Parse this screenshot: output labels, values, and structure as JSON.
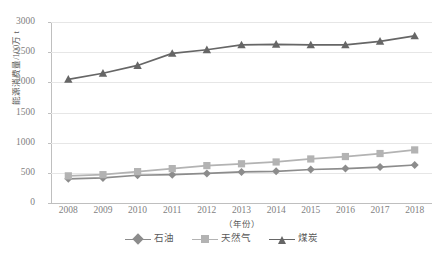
{
  "chart_data": {
    "type": "line",
    "title": "",
    "xlabel": "（年份）",
    "ylabel": "能源消费量/100万 t",
    "x": [
      2008,
      2009,
      2010,
      2011,
      2012,
      2013,
      2014,
      2015,
      2016,
      2017,
      2018
    ],
    "categories": [
      "2008",
      "2009",
      "2010",
      "2011",
      "2012",
      "2013",
      "2014",
      "2015",
      "2016",
      "2017",
      "2018"
    ],
    "ylim": [
      0,
      3000
    ],
    "yticks": [
      0,
      500,
      1000,
      1500,
      2000,
      2500,
      3000
    ],
    "ytick_labels": [
      "0",
      "500",
      "1000",
      "1500",
      "2000",
      "2500",
      "3000"
    ],
    "grid": true,
    "legend_position": "bottom",
    "series": [
      {
        "name": "石油",
        "marker": "diamond",
        "color": "#8c8c8c",
        "values": [
          400,
          415,
          460,
          470,
          490,
          515,
          525,
          555,
          570,
          595,
          630
        ]
      },
      {
        "name": "天然气",
        "marker": "square",
        "color": "#b3b3b3",
        "values": [
          450,
          470,
          520,
          570,
          620,
          650,
          680,
          730,
          770,
          820,
          880
        ]
      },
      {
        "name": "煤炭",
        "marker": "triangle",
        "color": "#666666",
        "values": [
          2050,
          2150,
          2280,
          2480,
          2540,
          2620,
          2630,
          2620,
          2620,
          2680,
          2770
        ]
      }
    ]
  },
  "legend": {
    "items": [
      {
        "label": "石油"
      },
      {
        "label": "天然气"
      },
      {
        "label": "煤炭"
      }
    ]
  },
  "colors": {
    "oil": "#8c8c8c",
    "gas": "#b3b3b3",
    "coal": "#666666",
    "grid": "#e6e6e6",
    "axis": "#bfbfbf",
    "text": "#7f7f7f"
  }
}
